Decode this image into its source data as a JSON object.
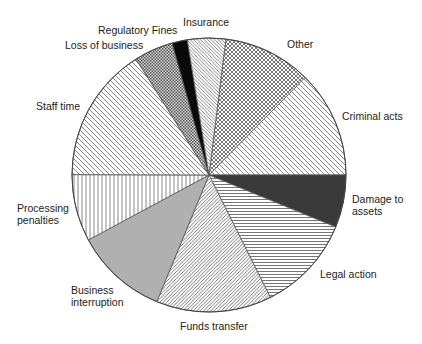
{
  "chart_data": {
    "type": "pie",
    "title": "",
    "start_angle_deg_from_top": 7.1,
    "direction": "clockwise",
    "legend": "none (labels placed next to slices)",
    "slices": [
      {
        "label": "Other",
        "value": 10.4,
        "pattern": "crosshatch"
      },
      {
        "label": "Criminal acts",
        "value": 12.6,
        "pattern": "diag-back"
      },
      {
        "label": "Damage to assets",
        "value": 6.2,
        "pattern": "solid-dark"
      },
      {
        "label": "Legal action",
        "value": 11.4,
        "pattern": "horizontal"
      },
      {
        "label": "Funds transfer",
        "value": 13.6,
        "pattern": "diag-fwd-dense"
      },
      {
        "label": "Business interruption",
        "value": 10.9,
        "pattern": "solid-light"
      },
      {
        "label": "Processing penalties",
        "value": 7.9,
        "pattern": "vertical"
      },
      {
        "label": "Staff time",
        "value": 16.0,
        "pattern": "diag-back"
      },
      {
        "label": "Loss of business",
        "value": 4.6,
        "pattern": "checker"
      },
      {
        "label": "Regulatory Fines",
        "value": 1.8,
        "pattern": "solid-black"
      },
      {
        "label": "Insurance",
        "value": 4.5,
        "pattern": "diag-back-dense"
      }
    ],
    "units": "percent (estimated from slice angles)"
  },
  "labels": {
    "other": "Other",
    "criminal": "Criminal acts",
    "damage_1": "Damage to",
    "damage_2": "assets",
    "legal": "Legal action",
    "funds": "Funds transfer",
    "business_1": "Business",
    "business_2": "interruption",
    "processing_1": "Processing",
    "processing_2": "penalties",
    "staff": "Staff time",
    "loss": "Loss of business",
    "regulatory": "Regulatory Fines",
    "insurance": "Insurance"
  },
  "colors": {
    "solid-dark": "#3a3a3a",
    "solid-light": "#b0b0b0",
    "solid-black": "#0a0a0a",
    "line": "#555555"
  }
}
